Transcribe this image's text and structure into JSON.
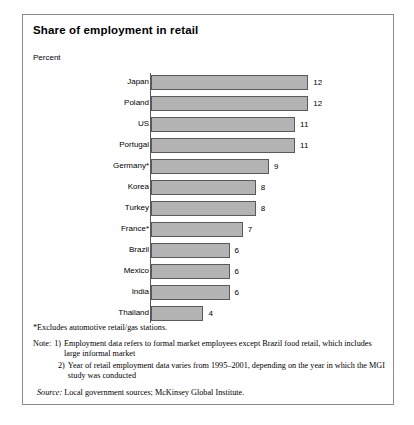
{
  "exhibit": {
    "title": "Share of employment in retail",
    "unit_label": "Percent"
  },
  "chart_data": {
    "type": "bar",
    "orientation": "horizontal",
    "title": "Share of employment in retail",
    "subtitle": "Percent",
    "xlabel": "",
    "ylabel": "",
    "xlim": [
      0,
      13
    ],
    "grid": false,
    "legend": null,
    "categories": [
      "Japan",
      "Poland",
      "US",
      "Portugal",
      "Germany*",
      "Korea",
      "Turkey",
      "France*",
      "Brazil",
      "Mexico",
      "India",
      "Thailand"
    ],
    "values": [
      12,
      12,
      11,
      11,
      9,
      8,
      8,
      7,
      6,
      6,
      6,
      4
    ],
    "value_labels": [
      "12",
      "12",
      "11",
      "11",
      "9",
      "8",
      "8",
      "7",
      "6",
      "6",
      "6",
      "4"
    ],
    "rows": [
      {
        "label": "Japan",
        "value": 12,
        "value_label": "12"
      },
      {
        "label": "Poland",
        "value": 12,
        "value_label": "12"
      },
      {
        "label": "US",
        "value": 11,
        "value_label": "11"
      },
      {
        "label": "Portugal",
        "value": 11,
        "value_label": "11"
      },
      {
        "label": "Germany*",
        "value": 9,
        "value_label": "9"
      },
      {
        "label": "Korea",
        "value": 8,
        "value_label": "8"
      },
      {
        "label": "Turkey",
        "value": 8,
        "value_label": "8"
      },
      {
        "label": "France*",
        "value": 7,
        "value_label": "7"
      },
      {
        "label": "Brazil",
        "value": 6,
        "value_label": "6"
      },
      {
        "label": "Mexico",
        "value": 6,
        "value_label": "6"
      },
      {
        "label": "India",
        "value": 6,
        "value_label": "6"
      },
      {
        "label": "Thailand",
        "value": 4,
        "value_label": "4"
      }
    ],
    "colors": {
      "bar_fill": "#b3b3b3",
      "bar_border": "#5a5a5a",
      "axis": "#5a5a5a",
      "frame": "#8a8a8a",
      "text": "#000000"
    }
  },
  "footnotes": {
    "asterisk": "*Excludes automotive retail/gas stations.",
    "note_lead": "Note:",
    "notes": [
      {
        "num": "1)",
        "text": "Employment data refers to formal market employees except Brazil food retail, which includes large informal market"
      },
      {
        "num": "2)",
        "text": "Year of retail employment data varies from 1995–2001, depending on the year in which the MGI study was conducted"
      }
    ],
    "source_lead": "Source:",
    "source_text": "Local government sources; McKinsey Global Institute."
  }
}
